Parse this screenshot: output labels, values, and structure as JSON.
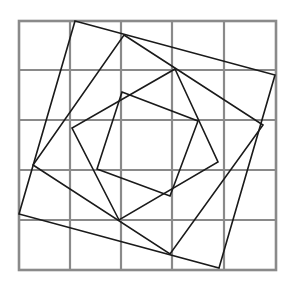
{
  "diagram": {
    "title": "",
    "colors": {
      "grid": "#8a8a8a",
      "lines": "#1a1a1a",
      "background": "#ffffff"
    },
    "grid": {
      "columns": 5,
      "rows": 5,
      "x_lines": [
        19,
        70,
        121,
        172,
        224,
        276
      ],
      "y_lines": [
        21,
        70,
        120,
        170,
        220,
        270
      ]
    },
    "squares": [
      {
        "name": "outer",
        "points": [
          [
            75,
            21
          ],
          [
            275,
            75
          ],
          [
            219,
            268
          ],
          [
            19,
            214
          ]
        ]
      },
      {
        "name": "second",
        "points": [
          [
            124,
            35
          ],
          [
            263,
            125
          ],
          [
            170,
            254
          ],
          [
            33,
            165
          ]
        ]
      },
      {
        "name": "third",
        "points": [
          [
            175,
            69
          ],
          [
            218,
            162
          ],
          [
            119,
            220
          ],
          [
            72,
            128
          ]
        ]
      },
      {
        "name": "inner",
        "points": [
          [
            122,
            92
          ],
          [
            198,
            121
          ],
          [
            170,
            196
          ],
          [
            97,
            169
          ]
        ]
      }
    ]
  }
}
